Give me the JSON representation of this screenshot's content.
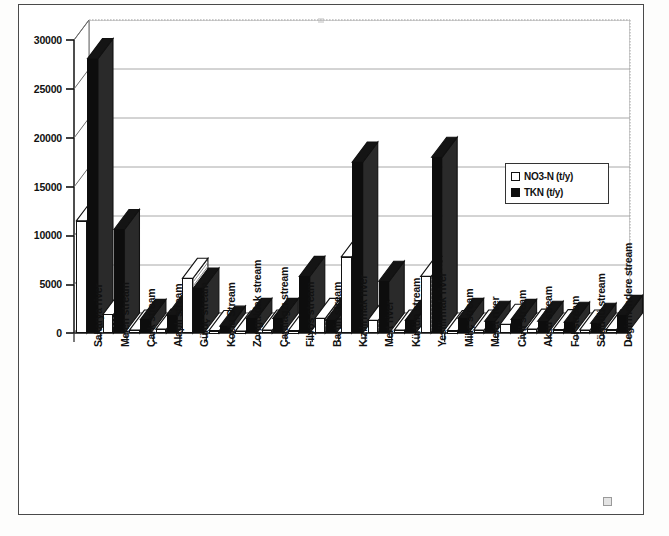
{
  "chart_data": {
    "type": "bar",
    "title": "",
    "xlabel": "",
    "ylabel": "",
    "ylim": [
      0,
      30000
    ],
    "ytick_labels": [
      "0",
      "5000",
      "10000",
      "15000",
      "20000",
      "25000",
      "30000"
    ],
    "ytick_values": [
      0,
      5000,
      10000,
      15000,
      20000,
      25000,
      30000
    ],
    "grid": true,
    "legend_position": "right-inside",
    "style": "3d-clustered-column",
    "categories": [
      "Sakarya river",
      "Melen stream",
      "Çark stream",
      "Alaplı stream",
      "Gülüç stream",
      "Kozlu Stream",
      "Zonguldak stream",
      "Çatalagzı stream",
      "Filyos stream",
      "Bartin stream",
      "Kızılırmak river",
      "Mert river",
      "Kürtün stream",
      "Yesilirmak river",
      "Miliç stream",
      "Melet river",
      "Civil stream",
      "Aksu stream",
      "Fol stream",
      "Söğütlü stream",
      "Degirmendere stream"
    ],
    "series": [
      {
        "name": "NO3-N (t/y)",
        "color": "#ffffff",
        "values": [
          11500,
          1900,
          300,
          400,
          5600,
          250,
          200,
          300,
          250,
          1500,
          7800,
          1300,
          300,
          5800,
          250,
          300,
          900,
          400,
          350,
          300,
          350
        ]
      },
      {
        "name": "TKN (t/y)",
        "color": "#0d0d0d",
        "values": [
          28100,
          10600,
          1400,
          1800,
          4600,
          700,
          1500,
          1500,
          5800,
          1300,
          17500,
          5300,
          1300,
          18000,
          1500,
          1200,
          1400,
          1200,
          1100,
          1000,
          1800
        ]
      }
    ]
  },
  "legend": {
    "entries": [
      {
        "label": "NO3-N (t/y)",
        "marker": "hollow-square"
      },
      {
        "label": "TKN (t/y)",
        "marker": "filled-square"
      }
    ]
  },
  "axes": {
    "y_max_label": "30000",
    "y_min_label": "0"
  }
}
